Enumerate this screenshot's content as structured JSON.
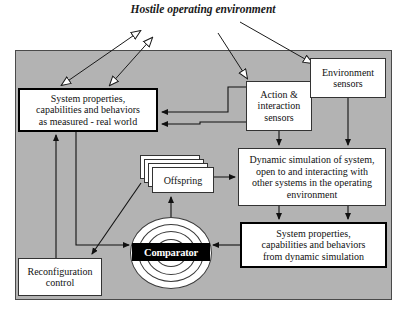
{
  "diagram": {
    "title": "Hostile operating\nenvironment",
    "panel_color": "#b3b3b3",
    "nodes": {
      "system_properties_real": "System properties,\ncapabilities and behaviors\nas measured - real world",
      "action_interaction_sensors": "Action &\ninteraction\nsensors",
      "environment_sensors": "Environment\nsensors",
      "dynamic_simulation": "Dynamic simulation of system,\nopen to and interacting with\nother systems in the operating\nenvironment",
      "system_properties_sim": "System properties,\ncapabilities and behaviors\nfrom dynamic simulation",
      "reconfiguration_control": "Reconfiguration\ncontrol",
      "offspring": "Offspring",
      "comparator": "Comparator"
    }
  }
}
